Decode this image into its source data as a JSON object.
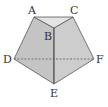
{
  "diagram": {
    "type": "folded-pentagon",
    "colors": {
      "face_fill": "#c8c8c8",
      "top_fill": "#e2e2e2",
      "stroke": "#555555",
      "dashed": "#555555"
    },
    "points": {
      "A": {
        "label": "A",
        "x": 34,
        "y": 17
      },
      "B": {
        "label": "B",
        "x": 54,
        "y": 28
      },
      "C": {
        "label": "C",
        "x": 73,
        "y": 17
      },
      "D": {
        "label": "D",
        "x": 14,
        "y": 59
      },
      "E": {
        "label": "E",
        "x": 54,
        "y": 84
      },
      "F": {
        "label": "F",
        "x": 94,
        "y": 59
      }
    },
    "labels": {
      "A": "A",
      "B": "B",
      "C": "C",
      "D": "D",
      "E": "E",
      "F": "F"
    }
  }
}
